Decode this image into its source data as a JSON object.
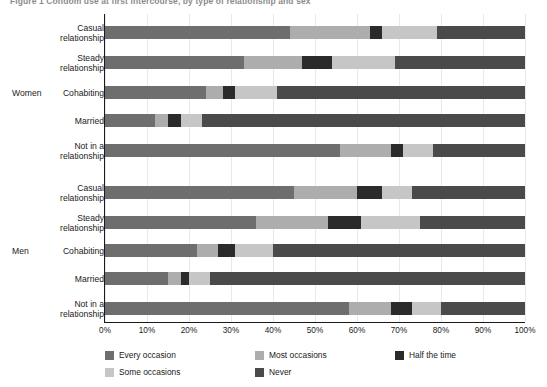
{
  "figure": {
    "title": "Figure 1 Condom use at first intercourse, by type of relationship and sex"
  },
  "axis": {
    "ticks": [
      "0%",
      "10%",
      "20%",
      "30%",
      "40%",
      "50%",
      "60%",
      "70%",
      "80%",
      "90%",
      "100%"
    ],
    "min": 0,
    "max": 100
  },
  "groups": [
    {
      "name": "Women"
    },
    {
      "name": "Men"
    }
  ],
  "legend": [
    {
      "label": "Every occasion",
      "color": "#6e6e6e"
    },
    {
      "label": "Most occasions",
      "color": "#adadad"
    },
    {
      "label": "Half the time",
      "color": "#2b2b2b"
    },
    {
      "label": "Some occasions",
      "color": "#c6c6c6"
    },
    {
      "label": "Never",
      "color": "#4a4a4a"
    }
  ],
  "chart_data": {
    "type": "bar",
    "orientation": "horizontal",
    "stacked": true,
    "normalized": "100%",
    "title": "Figure 1 Condom use at first intercourse, by type of relationship and sex",
    "xlabel": "",
    "ylabel": "",
    "xlim": [
      0,
      100
    ],
    "grid": true,
    "legend_position": "bottom",
    "categories": [
      "Women - Casual relationship",
      "Women - Steady relationship",
      "Women - Cohabiting",
      "Women - Married",
      "Women - Not in a relationship",
      "Men - Casual relationship",
      "Men - Steady relationship",
      "Men - Cohabiting",
      "Men - Married",
      "Men - Not in a relationship"
    ],
    "series": [
      {
        "name": "Every occasion",
        "color": "#6e6e6e",
        "values": [
          44,
          33,
          24,
          12,
          56,
          45,
          36,
          22,
          15,
          58
        ]
      },
      {
        "name": "Most occasions",
        "color": "#adadad",
        "values": [
          19,
          14,
          4,
          3,
          12,
          15,
          17,
          5,
          3,
          10
        ]
      },
      {
        "name": "Half the time",
        "color": "#2b2b2b",
        "values": [
          3,
          7,
          3,
          3,
          3,
          6,
          8,
          4,
          2,
          5
        ]
      },
      {
        "name": "Some occasions",
        "color": "#c6c6c6",
        "values": [
          13,
          15,
          10,
          5,
          7,
          7,
          14,
          9,
          5,
          7
        ]
      },
      {
        "name": "Never",
        "color": "#4a4a4a",
        "values": [
          21,
          31,
          59,
          77,
          22,
          27,
          25,
          60,
          75,
          20
        ]
      }
    ]
  },
  "rows": [
    {
      "group": "Women",
      "label_line1": "Casual",
      "label_line2": "relationship",
      "values": [
        44,
        19,
        3,
        13,
        21
      ]
    },
    {
      "group": "Women",
      "label_line1": "Steady",
      "label_line2": "relationship",
      "values": [
        33,
        14,
        7,
        15,
        31
      ]
    },
    {
      "group": "Women",
      "label_line1": "Cohabiting",
      "label_line2": "",
      "values": [
        24,
        4,
        3,
        10,
        59
      ]
    },
    {
      "group": "Women",
      "label_line1": "Married",
      "label_line2": "",
      "values": [
        12,
        3,
        3,
        5,
        77
      ]
    },
    {
      "group": "Women",
      "label_line1": "Not in a",
      "label_line2": "relationship",
      "values": [
        56,
        12,
        3,
        7,
        22
      ]
    },
    {
      "group": "Men",
      "label_line1": "Casual",
      "label_line2": "relationship",
      "values": [
        45,
        15,
        6,
        7,
        27
      ]
    },
    {
      "group": "Men",
      "label_line1": "Steady",
      "label_line2": "relationship",
      "values": [
        36,
        17,
        8,
        14,
        25
      ]
    },
    {
      "group": "Men",
      "label_line1": "Cohabiting",
      "label_line2": "",
      "values": [
        22,
        5,
        4,
        9,
        60
      ]
    },
    {
      "group": "Men",
      "label_line1": "Married",
      "label_line2": "",
      "values": [
        15,
        3,
        2,
        5,
        75
      ]
    },
    {
      "group": "Men",
      "label_line1": "Not in a",
      "label_line2": "relationship",
      "values": [
        58,
        10,
        5,
        7,
        20
      ]
    }
  ]
}
